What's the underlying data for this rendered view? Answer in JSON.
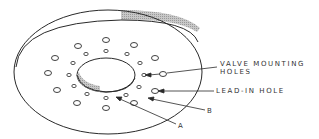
{
  "diagram": {
    "colors": {
      "line": "#2a2a2a",
      "hatch": "#bdbdbd",
      "text": "#333333",
      "background": "#ffffff"
    },
    "labels": {
      "valve_mounting_line1": "VALVE MOUNTING",
      "valve_mounting_line2": "HOLES",
      "lead_in_hole": "LEAD-IN HOLE",
      "callout_a": "A",
      "callout_b": "B"
    }
  }
}
